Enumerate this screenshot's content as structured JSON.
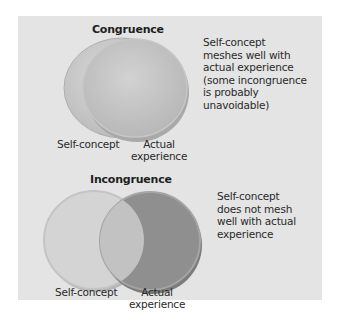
{
  "panels": [
    {
      "id": "congruence",
      "title": "Congruence",
      "left_label": "Self-concept",
      "right_label_line1": "Actual",
      "right_label_line2": "experience",
      "description": [
        "Self-concept",
        "meshes well with",
        "actual experience",
        "(some incongruence",
        "is probably",
        "unavoidable)"
      ]
    },
    {
      "id": "incongruence",
      "title": "Incongruence",
      "left_label": "Self-concept",
      "right_label_line1": "Actual",
      "right_label_line2": "experience",
      "description": [
        "Self-concept",
        "does not mesh",
        "well with actual",
        "experience"
      ]
    }
  ],
  "colors": {
    "background": "#ffffff",
    "panel": "#e4e4e4",
    "self_concept_circle": "#cfcfcf",
    "experience_circle_light": "#c6c6c6",
    "experience_circle_dark": "#8e8e8e",
    "overlap": "#bdbdbd"
  }
}
